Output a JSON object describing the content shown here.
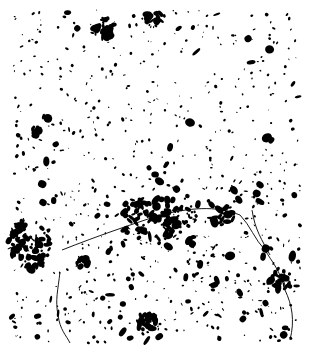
{
  "map": {
    "width": 313,
    "height": 358,
    "background": "#ffffff",
    "ink": "#000000",
    "extent": {
      "x0": 12,
      "y0": 10,
      "x1": 300,
      "y1": 343
    },
    "cities": [
      {
        "name": "large-center",
        "cx": 155,
        "cy": 218,
        "rx": 40,
        "ry": 22,
        "count": 90
      },
      {
        "name": "west-city",
        "cx": 28,
        "cy": 245,
        "rx": 22,
        "ry": 26,
        "count": 70
      },
      {
        "name": "top-city-1",
        "cx": 105,
        "cy": 28,
        "rx": 10,
        "ry": 10,
        "count": 25
      },
      {
        "name": "top-city-2",
        "cx": 154,
        "cy": 18,
        "rx": 9,
        "ry": 6,
        "count": 20
      },
      {
        "name": "south-city",
        "cx": 147,
        "cy": 322,
        "rx": 10,
        "ry": 12,
        "count": 30
      },
      {
        "name": "east-city",
        "cx": 282,
        "cy": 280,
        "rx": 12,
        "ry": 9,
        "count": 28
      },
      {
        "name": "mid-east",
        "cx": 222,
        "cy": 215,
        "rx": 12,
        "ry": 10,
        "count": 25
      },
      {
        "name": "northwest-town",
        "cx": 36,
        "cy": 130,
        "rx": 6,
        "ry": 6,
        "count": 10
      },
      {
        "name": "mid-west",
        "cx": 80,
        "cy": 262,
        "rx": 8,
        "ry": 6,
        "count": 12
      }
    ],
    "rivers": [
      "M60,272 C58,290 55,300 58,315 C60,330 66,335 70,343",
      "M62,250 C100,235 130,225 160,215 C190,208 215,205 240,215 C250,225 255,240 265,250 C272,262 280,270 285,290 C292,305 295,320 290,340",
      "M252,210 C255,230 262,240 270,255"
    ],
    "scatter": {
      "count": 900,
      "seed": 7
    }
  }
}
